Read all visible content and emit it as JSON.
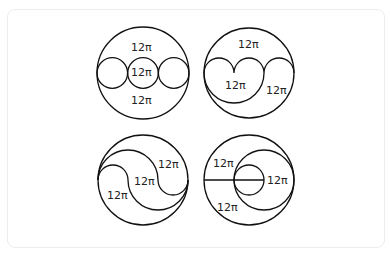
{
  "figure": {
    "panels": [
      {
        "id": "top-left",
        "labels": [
          "12π",
          "12π",
          "12π"
        ]
      },
      {
        "id": "top-right",
        "labels": [
          "12π",
          "12π",
          "12π"
        ]
      },
      {
        "id": "bottom-left",
        "labels": [
          "12π",
          "12π",
          "12π"
        ]
      },
      {
        "id": "bottom-right",
        "labels": [
          "12π",
          "12π",
          "12π"
        ]
      }
    ]
  }
}
